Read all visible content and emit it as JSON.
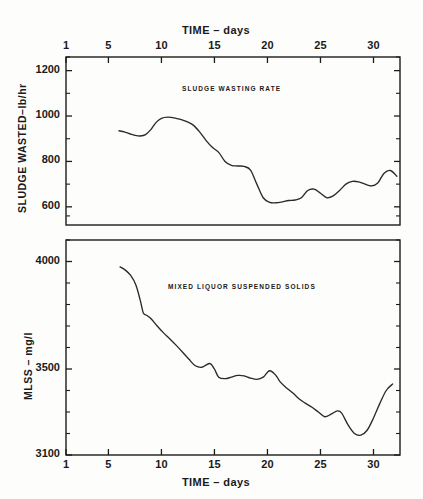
{
  "figure": {
    "top_axis_title": "TIME – days",
    "bottom_axis_title": "TIME – days",
    "upper_y_title": "SLUDGE  WASTED–lb/hr",
    "lower_y_title": "MLSS – mg/l",
    "upper_plot_title": "SLUDGE  WASTING  RATE",
    "lower_plot_title": "MIXED  LIQUOR  SUSPENDED  SOLIDS",
    "line_color": "#2a2a2a",
    "axis_color": "#1c1c1c",
    "background": "#fdfdfc"
  },
  "chart_data": [
    {
      "type": "line",
      "title": "SLUDGE  WASTING  RATE",
      "xlabel": "TIME – days",
      "ylabel": "SLUDGE  WASTED–lb/hr",
      "xlim": [
        1,
        32.5
      ],
      "ylim": [
        520,
        1260
      ],
      "xticks": [
        1,
        5,
        10,
        15,
        20,
        25,
        30
      ],
      "xticklabels": [
        "1",
        "5",
        "10",
        "15",
        "20",
        "25",
        "30"
      ],
      "yticks": [
        600,
        800,
        1000,
        1200
      ],
      "yticklabels": [
        "600",
        "800",
        "1000",
        "1200"
      ],
      "yminorticks": [
        560,
        700,
        900,
        1100,
        1260
      ],
      "grid": false,
      "legend": false,
      "axis_position": "top",
      "x": [
        6.0,
        6.5,
        7.0,
        7.5,
        8.0,
        8.5,
        9.0,
        9.5,
        10.0,
        10.6,
        11.2,
        11.8,
        12.4,
        13.0,
        13.6,
        14.2,
        14.8,
        15.4,
        16.0,
        16.6,
        17.2,
        17.8,
        18.4,
        19.0,
        19.6,
        20.2,
        20.8,
        21.4,
        22.0,
        22.6,
        23.2,
        23.8,
        24.4,
        25.0,
        25.6,
        26.2,
        26.8,
        27.4,
        28.0,
        28.6,
        29.2,
        29.8,
        30.4,
        31.0,
        31.6,
        32.2
      ],
      "values": [
        935,
        930,
        922,
        915,
        912,
        918,
        940,
        972,
        990,
        995,
        992,
        985,
        975,
        960,
        930,
        893,
        862,
        840,
        800,
        783,
        780,
        778,
        762,
        700,
        640,
        620,
        618,
        622,
        628,
        630,
        640,
        672,
        678,
        660,
        640,
        648,
        672,
        700,
        712,
        710,
        700,
        692,
        705,
        748,
        760,
        735
      ]
    },
    {
      "type": "line",
      "title": "MIXED  LIQUOR  SUSPENDED  SOLIDS",
      "xlabel": "TIME – days",
      "ylabel": "MLSS – mg/l",
      "xlim": [
        1,
        32.5
      ],
      "ylim": [
        3100,
        4100
      ],
      "xticks": [
        1,
        5,
        10,
        15,
        20,
        25,
        30
      ],
      "xticklabels": [
        "1",
        "5",
        "10",
        "15",
        "20",
        "25",
        "30"
      ],
      "yticks": [
        3100,
        3500,
        4000
      ],
      "yticklabels": [
        "3100",
        "3500",
        "4000"
      ],
      "yminorticks": [
        3200,
        3300,
        3400,
        3600,
        3700,
        3800,
        3900,
        4100
      ],
      "grid": false,
      "legend": false,
      "axis_position": "bottom",
      "x": [
        6.1,
        6.6,
        7.1,
        7.6,
        8.0,
        8.3,
        8.6,
        9.0,
        9.6,
        10.2,
        10.8,
        11.4,
        12.0,
        12.6,
        13.2,
        13.8,
        14.2,
        14.6,
        15.0,
        15.4,
        16.0,
        16.6,
        17.2,
        17.8,
        18.4,
        19.0,
        19.6,
        20.2,
        20.8,
        21.2,
        21.8,
        22.4,
        23.0,
        23.6,
        24.2,
        24.8,
        25.4,
        26.0,
        26.6,
        27.0,
        27.6,
        28.2,
        28.8,
        29.4,
        30.0,
        30.6,
        31.2,
        31.8
      ],
      "values": [
        3975,
        3960,
        3935,
        3890,
        3820,
        3760,
        3750,
        3735,
        3700,
        3668,
        3640,
        3610,
        3578,
        3545,
        3515,
        3508,
        3518,
        3525,
        3500,
        3462,
        3455,
        3462,
        3470,
        3468,
        3458,
        3452,
        3462,
        3492,
        3470,
        3440,
        3412,
        3388,
        3360,
        3340,
        3322,
        3300,
        3278,
        3290,
        3305,
        3295,
        3240,
        3200,
        3192,
        3215,
        3272,
        3340,
        3400,
        3430
      ]
    }
  ]
}
